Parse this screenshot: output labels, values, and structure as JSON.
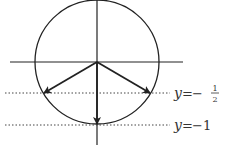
{
  "diagram": {
    "type": "unit-circle-vectors",
    "circle": {
      "cx": 97,
      "cy": 62,
      "r": 62,
      "stroke": "#222222"
    },
    "axes": {
      "horizontal": {
        "x1": 10,
        "y1": 62,
        "x2": 183,
        "y2": 62
      },
      "vertical": {
        "x1": 97,
        "y1": 0,
        "x2": 97,
        "y2": 145
      }
    },
    "vectors": [
      {
        "name": "left-lower",
        "x2": 44,
        "y2": 93
      },
      {
        "name": "right-lower",
        "x2": 150,
        "y2": 93
      },
      {
        "name": "down",
        "x2": 97,
        "y2": 124
      }
    ],
    "dotted_lines": [
      {
        "y": 93,
        "x1": 5,
        "x2": 170,
        "label_var": "y",
        "label_eq": "=",
        "label_sign": "−",
        "label_num": "1",
        "label_den": "2"
      },
      {
        "y": 125,
        "x1": 5,
        "x2": 170,
        "label_var": "y",
        "label_eq": "=",
        "label_value": "−1"
      }
    ]
  }
}
